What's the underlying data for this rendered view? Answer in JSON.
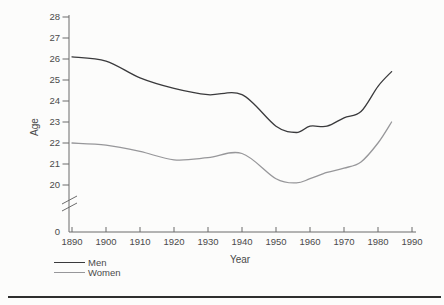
{
  "figure": {
    "background": "#fcfcfb",
    "bottom_rule_color": "#2e2e2e"
  },
  "chart_data": {
    "type": "line",
    "title": "",
    "xlabel": "Year",
    "ylabel": "Age",
    "grid": false,
    "legend_position": "bottom-left",
    "xlim": [
      1890,
      1990
    ],
    "ylim_upper_segment": [
      20,
      28
    ],
    "y_axis_break": true,
    "y_origin_label": "0",
    "x_ticks": [
      1890,
      1900,
      1910,
      1920,
      1930,
      1940,
      1950,
      1960,
      1970,
      1980,
      1990
    ],
    "y_ticks": [
      28,
      27,
      26,
      25,
      24,
      23,
      22,
      21,
      20
    ],
    "x": [
      1890,
      1900,
      1910,
      1920,
      1930,
      1940,
      1950,
      1956,
      1960,
      1965,
      1970,
      1975,
      1980,
      1984
    ],
    "series": [
      {
        "name": "Men",
        "color": "#3a3a3c",
        "values": [
          26.1,
          25.9,
          25.1,
          24.6,
          24.3,
          24.3,
          22.8,
          22.5,
          22.8,
          22.8,
          23.2,
          23.5,
          24.7,
          25.4
        ]
      },
      {
        "name": "Women",
        "color": "#97979a",
        "values": [
          22.0,
          21.9,
          21.6,
          21.2,
          21.3,
          21.5,
          20.3,
          20.1,
          20.3,
          20.6,
          20.8,
          21.1,
          22.0,
          23.0
        ]
      }
    ],
    "axis_color": "#6b6b6b",
    "tick_label_color": "#4a4a4a"
  }
}
